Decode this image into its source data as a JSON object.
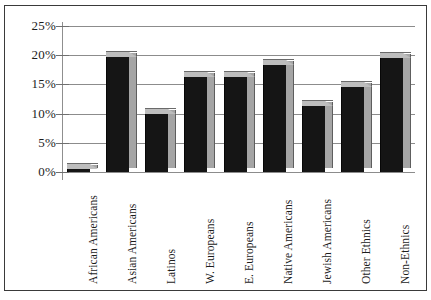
{
  "chart_data": {
    "type": "bar",
    "title": "",
    "subtitle": "",
    "xlabel": "",
    "ylabel": "",
    "categories": [
      "African Americans",
      "Asian Americans",
      "Latinos",
      "W. Europeans",
      "E. Europeans",
      "Native Americans",
      "Jewish Americans",
      "Other Ethnics",
      "Non-Ethnics"
    ],
    "values": [
      0.0,
      20.5,
      10.8,
      17.2,
      17.2,
      19.2,
      12.2,
      15.4,
      20.3
    ],
    "ylim": [
      0,
      25
    ],
    "ytick_values": [
      0,
      5,
      10,
      15,
      20,
      25
    ],
    "ytick_labels": [
      "0%",
      "5%",
      "10%",
      "15%",
      "20%",
      "25%"
    ],
    "grid": true,
    "legend": false,
    "legend_position": "none",
    "style": "3d-bar",
    "colors": {
      "bar_front": "#151515",
      "bar_side": "#a5a5a5",
      "bar_top": "#bdbdbd",
      "gridline": "#8c8c8c",
      "axis": "#8f8f8f",
      "frame": "#3a3a3a",
      "text": "#1c1c1c",
      "background": "#ffffff"
    }
  }
}
